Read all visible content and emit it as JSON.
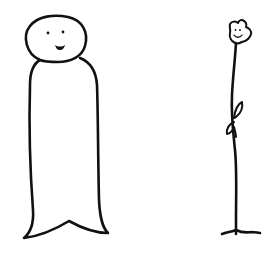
{
  "scene": {
    "description": "Hand-drawn doodle on white paper",
    "background": "#ffffff",
    "ink_color": "#111111",
    "figures": [
      {
        "name": "tall-person",
        "features": [
          "round head",
          "two dot eyes",
          "smiling mouth",
          "long rounded body",
          "pointed bottom hem"
        ]
      },
      {
        "name": "smiling-flower",
        "features": [
          "flower head with smile",
          "long thin stem",
          "two leaves",
          "grass line at base"
        ]
      }
    ]
  }
}
